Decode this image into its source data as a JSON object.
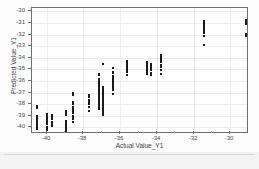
{
  "chart_data": {
    "type": "scatter",
    "title": "",
    "xlabel": "Actual Value_Y1",
    "ylabel": "Predicted Value_Y1",
    "xlim": [
      -40.8,
      -29.1
    ],
    "ylim": [
      -40.4,
      -29.7
    ],
    "xticks": [
      -40,
      -38,
      -36,
      -34,
      -32,
      -30
    ],
    "yticks": [
      -30,
      -31,
      -32,
      -33,
      -34,
      -35,
      -36,
      -37,
      -38,
      -39,
      -40
    ],
    "xticklabels": [
      "-40",
      "-38",
      "-36",
      "-34",
      "-32",
      "-30"
    ],
    "yticklabels": [
      "-30",
      "-31",
      "-32",
      "-33",
      "-34",
      "-35",
      "-36",
      "-37",
      "-38",
      "-39",
      "-40"
    ],
    "grid": true,
    "legend": false,
    "marker": "square",
    "marker_color": "#1a1a1a",
    "series": [
      {
        "name": "Predicted vs Actual",
        "points": [
          [
            -40.52,
            -38.12
          ],
          [
            -40.52,
            -38.3
          ],
          [
            -40.52,
            -39.02
          ],
          [
            -40.52,
            -39.18
          ],
          [
            -40.52,
            -39.3
          ],
          [
            -40.52,
            -39.42
          ],
          [
            -40.52,
            -39.55
          ],
          [
            -40.52,
            -39.7
          ],
          [
            -40.52,
            -39.88
          ],
          [
            -40.52,
            -40.05
          ],
          [
            -40.52,
            -40.18
          ],
          [
            -39.98,
            -38.85
          ],
          [
            -39.98,
            -39.05
          ],
          [
            -39.98,
            -39.22
          ],
          [
            -39.98,
            -39.4
          ],
          [
            -39.98,
            -39.58
          ],
          [
            -39.98,
            -39.75
          ],
          [
            -39.98,
            -39.95
          ],
          [
            -39.98,
            -40.12
          ],
          [
            -39.98,
            -40.25
          ],
          [
            -39.72,
            -38.95
          ],
          [
            -39.72,
            -39.1
          ],
          [
            -39.72,
            -39.3
          ],
          [
            -39.72,
            -39.5
          ],
          [
            -39.72,
            -39.68
          ],
          [
            -39.72,
            -39.85
          ],
          [
            -38.95,
            -38.55
          ],
          [
            -38.95,
            -38.72
          ],
          [
            -38.95,
            -38.9
          ],
          [
            -38.95,
            -39.45
          ],
          [
            -38.95,
            -39.62
          ],
          [
            -38.95,
            -39.8
          ],
          [
            -38.95,
            -39.98
          ],
          [
            -38.95,
            -40.15
          ],
          [
            -38.95,
            -40.28
          ],
          [
            -38.55,
            -37.05
          ],
          [
            -38.55,
            -37.22
          ],
          [
            -38.55,
            -37.85
          ],
          [
            -38.55,
            -38.02
          ],
          [
            -38.55,
            -38.25
          ],
          [
            -38.55,
            -38.45
          ],
          [
            -38.55,
            -38.62
          ],
          [
            -38.55,
            -38.8
          ],
          [
            -38.55,
            -38.98
          ],
          [
            -38.55,
            -39.15
          ],
          [
            -38.55,
            -39.32
          ],
          [
            -38.55,
            -39.5
          ],
          [
            -37.7,
            -37.25
          ],
          [
            -37.7,
            -37.42
          ],
          [
            -37.7,
            -37.62
          ],
          [
            -37.7,
            -37.82
          ],
          [
            -37.7,
            -38.0
          ],
          [
            -37.7,
            -38.2
          ],
          [
            -37.7,
            -38.62
          ],
          [
            -37.18,
            -35.38
          ],
          [
            -37.18,
            -35.52
          ],
          [
            -37.18,
            -35.8
          ],
          [
            -37.18,
            -35.95
          ],
          [
            -37.18,
            -36.1
          ],
          [
            -37.18,
            -36.25
          ],
          [
            -37.18,
            -36.42
          ],
          [
            -37.18,
            -36.58
          ],
          [
            -37.18,
            -36.72
          ],
          [
            -37.18,
            -36.88
          ],
          [
            -37.18,
            -37.02
          ],
          [
            -37.18,
            -37.18
          ],
          [
            -37.18,
            -37.32
          ],
          [
            -37.18,
            -37.48
          ],
          [
            -37.18,
            -37.62
          ],
          [
            -37.18,
            -37.78
          ],
          [
            -37.18,
            -37.95
          ],
          [
            -37.18,
            -38.1
          ],
          [
            -37.18,
            -38.28
          ],
          [
            -37.18,
            -38.45
          ],
          [
            -36.95,
            -34.52
          ],
          [
            -36.95,
            -36.55
          ],
          [
            -36.95,
            -36.72
          ],
          [
            -36.95,
            -36.9
          ],
          [
            -36.95,
            -37.05
          ],
          [
            -36.95,
            -37.2
          ],
          [
            -36.95,
            -37.38
          ],
          [
            -36.95,
            -37.55
          ],
          [
            -36.95,
            -37.72
          ],
          [
            -36.95,
            -37.9
          ],
          [
            -36.95,
            -38.08
          ],
          [
            -36.95,
            -38.25
          ],
          [
            -36.95,
            -38.42
          ],
          [
            -36.95,
            -38.6
          ],
          [
            -36.95,
            -38.78
          ],
          [
            -36.95,
            -38.95
          ],
          [
            -36.4,
            -34.88
          ],
          [
            -36.4,
            -35.18
          ],
          [
            -36.4,
            -35.35
          ],
          [
            -36.4,
            -35.55
          ],
          [
            -36.4,
            -35.72
          ],
          [
            -36.4,
            -35.9
          ],
          [
            -36.4,
            -36.08
          ],
          [
            -36.4,
            -36.25
          ],
          [
            -36.4,
            -36.42
          ],
          [
            -36.4,
            -36.6
          ],
          [
            -36.4,
            -36.8
          ],
          [
            -36.4,
            -37.15
          ],
          [
            -35.62,
            -34.28
          ],
          [
            -35.62,
            -34.42
          ],
          [
            -35.62,
            -34.58
          ],
          [
            -35.62,
            -34.75
          ],
          [
            -35.62,
            -34.92
          ],
          [
            -35.62,
            -35.08
          ],
          [
            -35.62,
            -35.25
          ],
          [
            -35.62,
            -35.45
          ],
          [
            -34.55,
            -34.32
          ],
          [
            -34.55,
            -34.5
          ],
          [
            -34.55,
            -34.68
          ],
          [
            -34.55,
            -34.85
          ],
          [
            -34.55,
            -35.02
          ],
          [
            -34.55,
            -35.2
          ],
          [
            -34.55,
            -35.38
          ],
          [
            -34.32,
            -34.55
          ],
          [
            -34.32,
            -34.72
          ],
          [
            -34.32,
            -34.9
          ],
          [
            -34.32,
            -35.08
          ],
          [
            -34.32,
            -35.28
          ],
          [
            -34.32,
            -35.45
          ],
          [
            -33.78,
            -33.72
          ],
          [
            -33.78,
            -33.88
          ],
          [
            -33.78,
            -34.05
          ],
          [
            -33.78,
            -34.22
          ],
          [
            -33.78,
            -34.4
          ],
          [
            -33.78,
            -34.58
          ],
          [
            -33.78,
            -34.78
          ],
          [
            -33.78,
            -35.02
          ],
          [
            -33.78,
            -35.42
          ],
          [
            -31.42,
            -30.82
          ],
          [
            -31.42,
            -30.98
          ],
          [
            -31.42,
            -31.15
          ],
          [
            -31.42,
            -31.32
          ],
          [
            -31.42,
            -31.5
          ],
          [
            -31.42,
            -31.68
          ],
          [
            -31.42,
            -31.88
          ],
          [
            -31.42,
            -32.08
          ],
          [
            -31.42,
            -32.9
          ],
          [
            -29.18,
            -30.75
          ],
          [
            -29.18,
            -30.95
          ],
          [
            -29.18,
            -31.12
          ],
          [
            -29.18,
            -31.95
          ],
          [
            -29.18,
            -32.15
          ]
        ]
      }
    ]
  }
}
